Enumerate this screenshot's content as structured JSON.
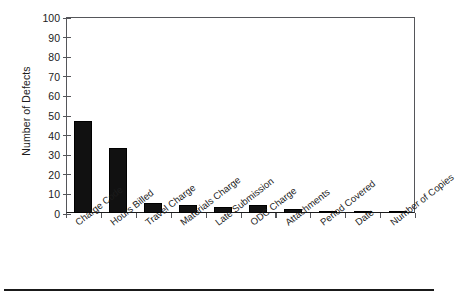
{
  "chart_data": {
    "type": "bar",
    "title": "",
    "xlabel": "",
    "ylabel": "Number of Defects",
    "ylim": [
      0,
      100
    ],
    "ytick_labels": [
      "100",
      "90",
      "80",
      "70",
      "60",
      "50",
      "40",
      "30",
      "20",
      "10",
      "0"
    ],
    "ytick_values": [
      100,
      90,
      80,
      70,
      60,
      50,
      40,
      30,
      20,
      10,
      0
    ],
    "grid": false,
    "legend": false,
    "bar_color": "#111111",
    "axis_color": "#55565a",
    "categories": [
      "Charge Code",
      "Hours Billed",
      "Travel Charge",
      "Materials Charge",
      "Late Submission",
      "ODC Charge",
      "Attachments",
      "Period Covered",
      "Date",
      "Number of Copies"
    ],
    "values": [
      47,
      33,
      5,
      4,
      3,
      4,
      2,
      1,
      1,
      1
    ]
  }
}
